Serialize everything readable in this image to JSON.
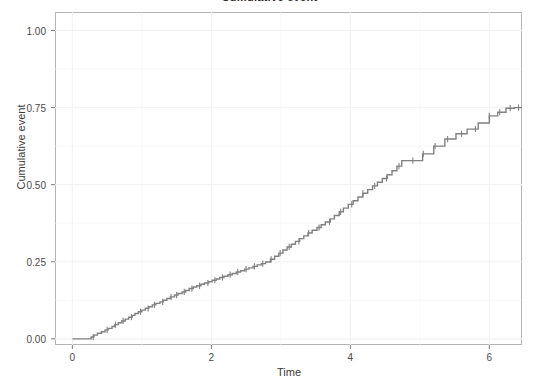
{
  "figure": {
    "title": "Cumulative event",
    "width": 539,
    "height": 384,
    "background_color": "#ffffff",
    "panel_background_color": "#ffffff",
    "panel_border_color": "#b4b4b4",
    "gridline_color": "#f2f2f2",
    "curve_color": "#808080"
  },
  "axes": {
    "y_title": "Cumulative event",
    "x_title": "Time",
    "y_ticks": [
      "0.00",
      "0.25",
      "0.50",
      "0.75",
      "1.00"
    ],
    "y_tick_values": [
      0.0,
      0.25,
      0.5,
      0.75,
      1.0
    ],
    "x_ticks": [
      "0",
      "2",
      "4",
      "6"
    ],
    "x_tick_values": [
      0,
      2,
      4,
      6
    ]
  },
  "chart_data": {
    "type": "line",
    "title": "Cumulative event",
    "xlabel": "Time",
    "ylabel": "Cumulative event",
    "xlim": [
      -0.25,
      6.47
    ],
    "ylim": [
      -0.02,
      1.06
    ],
    "grid": true,
    "legend": null,
    "plot_style": "step (Kaplan-Meier cumulative incidence) with censoring tick marks",
    "series": [
      {
        "name": "Cumulative event",
        "step_type": "hv",
        "x": [
          0.0,
          0.22,
          0.27,
          0.31,
          0.36,
          0.42,
          0.47,
          0.52,
          0.57,
          0.61,
          0.66,
          0.71,
          0.76,
          0.81,
          0.86,
          0.9,
          0.95,
          1.0,
          1.05,
          1.1,
          1.15,
          1.2,
          1.26,
          1.31,
          1.36,
          1.41,
          1.47,
          1.52,
          1.58,
          1.63,
          1.68,
          1.74,
          1.79,
          1.85,
          1.9,
          1.96,
          2.01,
          2.07,
          2.12,
          2.18,
          2.24,
          2.3,
          2.36,
          2.42,
          2.48,
          2.54,
          2.6,
          2.66,
          2.72,
          2.78,
          2.85,
          2.91,
          2.97,
          3.03,
          3.09,
          3.15,
          3.21,
          3.27,
          3.33,
          3.39,
          3.45,
          3.52,
          3.58,
          3.64,
          3.71,
          3.77,
          3.84,
          3.9,
          3.97,
          4.04,
          4.11,
          4.18,
          4.25,
          4.32,
          4.39,
          4.46,
          4.53,
          4.6,
          4.67,
          4.74,
          4.81,
          4.88,
          4.96,
          5.04,
          5.2,
          5.36,
          5.52,
          5.68,
          5.84,
          6.0,
          6.12,
          6.24,
          6.36,
          6.47
        ],
        "y": [
          0.0,
          0.0,
          0.006,
          0.012,
          0.018,
          0.023,
          0.029,
          0.034,
          0.04,
          0.046,
          0.052,
          0.058,
          0.064,
          0.07,
          0.076,
          0.082,
          0.088,
          0.093,
          0.099,
          0.104,
          0.11,
          0.115,
          0.12,
          0.125,
          0.131,
          0.136,
          0.142,
          0.147,
          0.152,
          0.157,
          0.163,
          0.168,
          0.172,
          0.177,
          0.181,
          0.185,
          0.19,
          0.194,
          0.199,
          0.203,
          0.208,
          0.212,
          0.217,
          0.221,
          0.226,
          0.23,
          0.235,
          0.24,
          0.244,
          0.249,
          0.258,
          0.268,
          0.278,
          0.288,
          0.298,
          0.307,
          0.316,
          0.325,
          0.334,
          0.343,
          0.352,
          0.361,
          0.37,
          0.379,
          0.389,
          0.4,
          0.412,
          0.424,
          0.436,
          0.448,
          0.46,
          0.472,
          0.484,
          0.496,
          0.508,
          0.52,
          0.532,
          0.545,
          0.56,
          0.578,
          0.578,
          0.578,
          0.578,
          0.6,
          0.625,
          0.648,
          0.665,
          0.68,
          0.7,
          0.723,
          0.735,
          0.748,
          0.75,
          0.75
        ],
        "censor_x": [
          0.3,
          0.5,
          0.62,
          0.73,
          0.85,
          0.98,
          1.09,
          1.18,
          1.3,
          1.42,
          1.5,
          1.61,
          1.72,
          1.83,
          1.95,
          2.05,
          2.16,
          2.27,
          2.38,
          2.5,
          2.62,
          2.74,
          2.86,
          2.99,
          3.12,
          3.26,
          3.4,
          3.55,
          3.7,
          3.86,
          4.02,
          4.18,
          4.35,
          4.52,
          4.7,
          4.9,
          5.05,
          5.22,
          5.4,
          5.6,
          5.8,
          6.0,
          6.15,
          6.3,
          6.42
        ]
      }
    ]
  }
}
